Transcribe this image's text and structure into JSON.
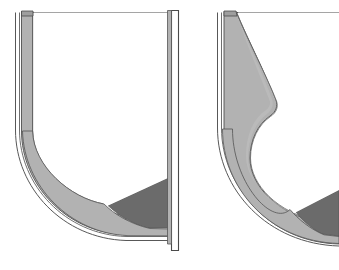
{
  "figure": {
    "title": "",
    "caption": "",
    "type": "technical-cross-section-drawing",
    "background_color": "#ffffff",
    "canvas": {
      "width": 339,
      "height": 270
    }
  },
  "palette": {
    "background": "#ffffff",
    "outline_stroke": "#3c3c3c",
    "thin_stroke": "#5a5a5a",
    "shell_fill": "#b2b2b2",
    "shell_fill_light": "#bfbfbf",
    "shell_fill_dark": "#a3a3a3",
    "cargo_fill": "#6b6b6b",
    "cargo_fill_dark": "#5f5f5f",
    "white_gap": "#ffffff",
    "deck_line": "#4a4a4a"
  },
  "panels": [
    {
      "id": "left-section",
      "name": "Left cross-section",
      "label": "",
      "features": [
        {
          "name": "deck-line",
          "kind": "horizontal top line"
        },
        {
          "name": "port-side-shell",
          "kind": "curved shell band",
          "fill": "#b2b2b2"
        },
        {
          "name": "outer-hull-line",
          "kind": "thin outer contour"
        },
        {
          "name": "starboard-bulkhead",
          "kind": "vertical bar"
        },
        {
          "name": "cargo-fill-region",
          "kind": "dark filled wedge",
          "fill": "#6b6b6b"
        },
        {
          "name": "inner-void",
          "kind": "white interior"
        }
      ],
      "geometry": {
        "deck_y": 12,
        "shell_top_x": 22,
        "shell_bottom_y": 238,
        "bulkhead_x": 171,
        "bulkhead_bottom_y": 250
      }
    },
    {
      "id": "right-section",
      "name": "Right cross-section",
      "label": "",
      "features": [
        {
          "name": "deck-line",
          "kind": "horizontal top line"
        },
        {
          "name": "tapered-shell-band",
          "kind": "curved tapered shell band",
          "fill": "#b2b2b2"
        },
        {
          "name": "outer-hull-line",
          "kind": "thin outer contour"
        },
        {
          "name": "cargo-fill-region",
          "kind": "dark filled wedge",
          "fill": "#6b6b6b"
        },
        {
          "name": "inner-void",
          "kind": "white interior"
        }
      ],
      "geometry": {
        "deck_y": 12,
        "shell_top_x": 225,
        "shell_bulge_x": 275,
        "shell_bulge_y": 105,
        "clipped_right_edge": 339
      }
    }
  ]
}
